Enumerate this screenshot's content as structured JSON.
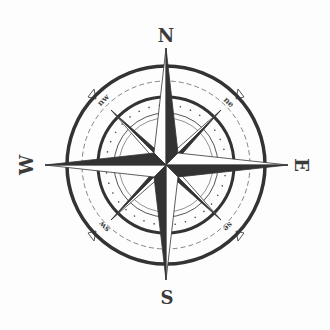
{
  "image": {
    "subject": "compass-rose",
    "colors": {
      "ink": "#333333",
      "light": "#ffffff",
      "background": "#fdfdfd"
    }
  },
  "cardinals": {
    "north": "N",
    "south": "S",
    "east": "E",
    "west": "W"
  },
  "intercardinals": {
    "northwest": "nw",
    "northeast": "ne",
    "southeast": "se",
    "southwest": "sw"
  }
}
